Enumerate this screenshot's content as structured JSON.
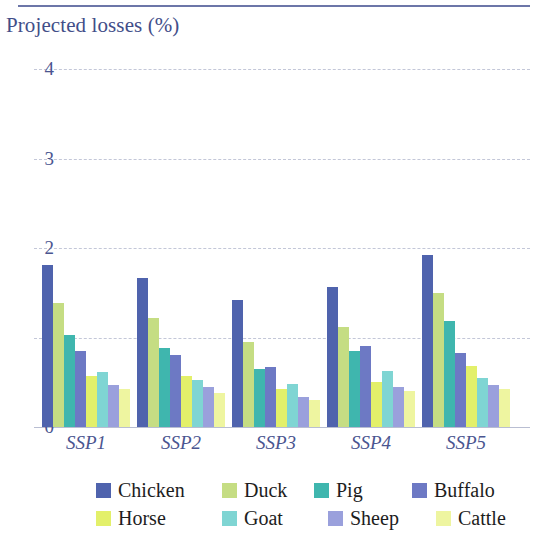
{
  "chart_data": {
    "type": "bar",
    "title": "Projected losses (%)",
    "xlabel": "",
    "ylabel": "",
    "ylim": [
      0,
      4
    ],
    "yticks": [
      0,
      1,
      2,
      3,
      4
    ],
    "ytick_labels": [
      "0",
      "1",
      "2",
      "3",
      "4"
    ],
    "grid": true,
    "grid_style": "dashed horizontal",
    "legend_position": "bottom",
    "categories": [
      "SSP1",
      "SSP2",
      "SSP3",
      "SSP4",
      "SSP5"
    ],
    "series": [
      {
        "name": "Chicken",
        "color": "#4f63ad",
        "values": [
          1.81,
          1.67,
          1.42,
          1.57,
          1.92
        ]
      },
      {
        "name": "Duck",
        "color": "#c5dd83",
        "values": [
          1.39,
          1.22,
          0.95,
          1.12,
          1.5
        ]
      },
      {
        "name": "Pig",
        "color": "#3fb6ae",
        "values": [
          1.03,
          0.88,
          0.65,
          0.85,
          1.18
        ]
      },
      {
        "name": "Buffalo",
        "color": "#6d79c4",
        "values": [
          0.85,
          0.8,
          0.67,
          0.9,
          0.83
        ]
      },
      {
        "name": "Horse",
        "color": "#e3f06a",
        "values": [
          0.57,
          0.57,
          0.42,
          0.5,
          0.68
        ]
      },
      {
        "name": "Goat",
        "color": "#7fd5d3",
        "values": [
          0.62,
          0.53,
          0.48,
          0.63,
          0.55
        ]
      },
      {
        "name": "Sheep",
        "color": "#9aa0dc",
        "values": [
          0.47,
          0.45,
          0.33,
          0.45,
          0.47
        ]
      },
      {
        "name": "Cattle",
        "color": "#eef5a0",
        "values": [
          0.42,
          0.38,
          0.3,
          0.4,
          0.43
        ]
      }
    ]
  },
  "legend": {
    "rows": [
      [
        "Chicken",
        "Duck",
        "Pig",
        "Buffalo"
      ],
      [
        "Horse",
        "Goat",
        "Sheep",
        "Cattle"
      ]
    ]
  },
  "colors": {
    "title": "#424e89",
    "axis_text": "#4a5590",
    "gridline": "#c3c7d8",
    "top_rule": "#6c76a8",
    "background": "#ffffff",
    "legend_text": "#1d1d1d"
  }
}
